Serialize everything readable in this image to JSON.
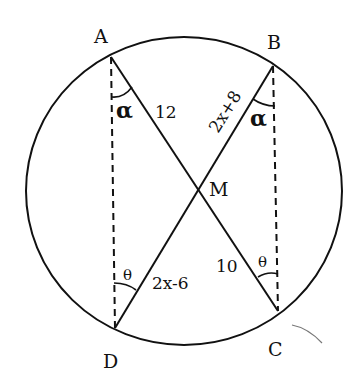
{
  "diagram": {
    "type": "circle-intersecting-chords",
    "points": {
      "A": "A",
      "B": "B",
      "C": "C",
      "D": "D",
      "M": "M"
    },
    "segments": {
      "AM": "12",
      "BM": "2x+8",
      "DM": "2x-6",
      "CM": "10"
    },
    "angles": {
      "at_A": "α",
      "at_B": "α",
      "at_D": "θ",
      "at_C": "θ"
    },
    "colors": {
      "stroke": "#111111",
      "background": "#ffffff"
    }
  }
}
